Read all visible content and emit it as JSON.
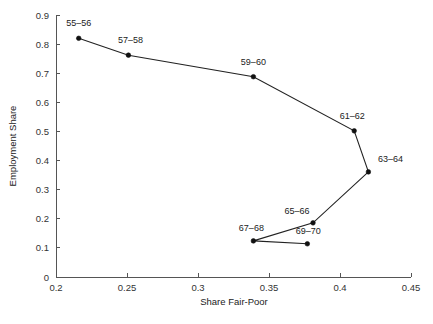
{
  "chart_data": {
    "type": "line",
    "title": "",
    "xlabel": "Share Fair-Poor",
    "ylabel": "Employment Share",
    "xlim": [
      0.2,
      0.45
    ],
    "ylim": [
      0,
      0.9
    ],
    "xticks": [
      "0.2",
      "0.25",
      "0.3",
      "0.35",
      "0.4",
      "0.45"
    ],
    "xtick_values": [
      0.2,
      0.25,
      0.3,
      0.35,
      0.4,
      0.45
    ],
    "yticks": [
      "0",
      "0.1",
      "0.2",
      "0.3",
      "0.4",
      "0.5",
      "0.6",
      "0.7",
      "0.8",
      "0.9"
    ],
    "ytick_values": [
      0,
      0.1,
      0.2,
      0.3,
      0.4,
      0.5,
      0.6,
      0.7,
      0.8,
      0.9
    ],
    "grid": false,
    "legend": "none",
    "marker": "filled-circle",
    "series": [
      {
        "name": "cohort-path",
        "points": [
          {
            "label": "55–56",
            "x": 0.216,
            "y": 0.82,
            "label_dx": 0,
            "label_dy": -12
          },
          {
            "label": "57–58",
            "x": 0.251,
            "y": 0.762,
            "label_dx": 2,
            "label_dy": -12
          },
          {
            "label": "59–60",
            "x": 0.339,
            "y": 0.688,
            "label_dx": 0,
            "label_dy": -12
          },
          {
            "label": "61–62",
            "x": 0.41,
            "y": 0.502,
            "label_dx": -2,
            "label_dy": -12
          },
          {
            "label": "63–64",
            "x": 0.42,
            "y": 0.361,
            "label_dx": 22,
            "label_dy": -10
          },
          {
            "label": "65–66",
            "x": 0.381,
            "y": 0.186,
            "label_dx": -16,
            "label_dy": -9
          },
          {
            "label": "67–68",
            "x": 0.339,
            "y": 0.124,
            "label_dx": -2,
            "label_dy": -10
          },
          {
            "label": "69–70",
            "x": 0.377,
            "y": 0.114,
            "label_dx": 1,
            "label_dy": -10
          }
        ]
      }
    ]
  },
  "axes_geometry": {
    "x0_px": 56,
    "x1_px": 411,
    "y0_px": 277,
    "y1_px": 15
  }
}
